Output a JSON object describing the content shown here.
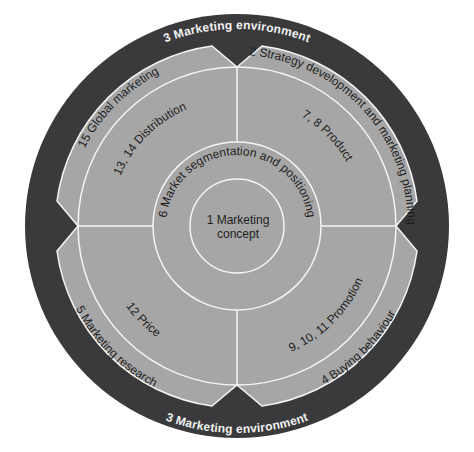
{
  "diagram": {
    "colors": {
      "background": "#ffffff",
      "outer_ring": "#3a3a3c",
      "segment_fill": "#a6a6a6",
      "divider": "#f4f4f4",
      "text": "#1e1e1e",
      "env_text": "#f2f2f2"
    },
    "environment": {
      "top_label": "3 Marketing environment",
      "bottom_label": "3 Marketing environment"
    },
    "outer_band": {
      "top_left": "15 Global marketing",
      "top_right": "2 Strategy development and marketing planning",
      "bottom_left": "5 Marketing research",
      "bottom_right": "4 Buying behaviour"
    },
    "quadrants": {
      "top_left": "13, 14 Distribution",
      "top_right": "7, 8 Product",
      "bottom_left": "12 Price",
      "bottom_right": "9, 10, 11 Promotion"
    },
    "middle_ring": {
      "label": "6 Market segmentation and positioning"
    },
    "core": {
      "line1": "1 Marketing",
      "line2": "concept"
    }
  }
}
